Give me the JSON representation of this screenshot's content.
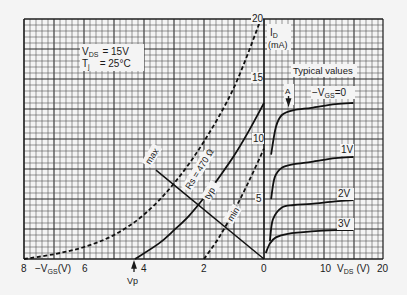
{
  "chart_data": {
    "type": "line",
    "conditions": {
      "vds_label": "V",
      "vds_sub": "DS",
      "vds_value": "= 15V",
      "tj_label": "T",
      "tj_sub": "j",
      "tj_value": "= 25°C"
    },
    "y_axis": {
      "label": "I",
      "label_sub": "D",
      "unit": "(mA)",
      "ticks": [
        "20",
        "15",
        "10",
        "5"
      ],
      "tick_values": [
        20,
        15,
        10,
        5
      ],
      "ylim": [
        0,
        20
      ]
    },
    "left_x_axis": {
      "label_prefix": "−V",
      "label_sub": "GS",
      "label_suffix": "(V)",
      "ticks": [
        "8",
        "6",
        "4",
        "2",
        "0"
      ],
      "tick_values": [
        8,
        6,
        4,
        2,
        0
      ],
      "xlim": [
        8,
        0
      ]
    },
    "right_x_axis": {
      "label_prefix": "V",
      "label_sub": "DS",
      "label_suffix": "(V)",
      "ticks": [
        "10",
        "20"
      ],
      "tick_values": [
        10,
        20
      ],
      "xlim": [
        0,
        20
      ]
    },
    "vp_label": "Vp",
    "vp_value": 4.3,
    "typical_label": "Typical values",
    "point_a_label": "A",
    "rs_label": "Rs = 470 Ω",
    "transfer_series": [
      {
        "name": "max",
        "style": "dashed",
        "x_neg_vgs": [
          8.0,
          7.0,
          6.0,
          5.0,
          4.0,
          3.0,
          2.0,
          1.0,
          0.1
        ],
        "y_id": [
          0.0,
          0.4,
          1.0,
          2.0,
          3.7,
          6.3,
          9.8,
          14.3,
          20.0
        ]
      },
      {
        "name": "typ",
        "style": "solid",
        "x_neg_vgs": [
          4.3,
          3.5,
          3.0,
          2.5,
          2.0,
          1.5,
          1.0,
          0.5,
          0.0
        ],
        "y_id": [
          0.0,
          1.3,
          2.4,
          3.6,
          5.1,
          6.8,
          8.6,
          10.7,
          13.0
        ]
      },
      {
        "name": "min",
        "style": "dashed",
        "x_neg_vgs": [
          2.0,
          1.5,
          1.0,
          0.5,
          0.0
        ],
        "y_id": [
          0.0,
          1.8,
          4.0,
          6.5,
          9.2
        ]
      }
    ],
    "load_line": {
      "name": "Rs = 470 Ω",
      "x_neg_vgs": [
        3.6,
        0.0
      ],
      "y_id": [
        7.4,
        0.0
      ]
    },
    "output_series": [
      {
        "name": "−VGS = 0",
        "label": "−V",
        "label_sub": "GS",
        "label_suffix": "=0",
        "x_vds": [
          1.2,
          2.0,
          3.0,
          5.0,
          8.0,
          12.0,
          15.0
        ],
        "y_id": [
          8.7,
          11.0,
          12.0,
          12.4,
          12.6,
          12.9,
          13.0
        ]
      },
      {
        "name": "1V",
        "label": "1V",
        "x_vds": [
          1.2,
          1.8,
          3.0,
          5.0,
          8.0,
          12.0,
          15.0
        ],
        "y_id": [
          5.0,
          6.8,
          7.6,
          7.9,
          8.1,
          8.4,
          8.5
        ]
      },
      {
        "name": "2V",
        "label": "2V",
        "x_vds": [
          1.0,
          1.5,
          3.0,
          5.0,
          8.0,
          12.0,
          15.0
        ],
        "y_id": [
          1.5,
          3.3,
          4.3,
          4.5,
          4.6,
          4.8,
          4.9
        ]
      },
      {
        "name": "3V",
        "label": "3V",
        "x_vds": [
          0.3,
          1.0,
          2.0,
          4.0,
          8.0,
          12.0,
          15.0
        ],
        "y_id": [
          0.5,
          1.3,
          1.8,
          2.1,
          2.3,
          2.4,
          2.4
        ]
      }
    ],
    "grid": true,
    "legend_position": "inline"
  }
}
